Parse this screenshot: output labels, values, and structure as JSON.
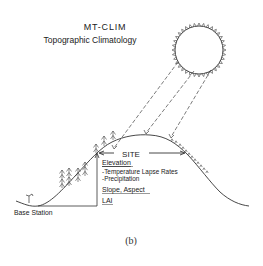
{
  "title": {
    "line1": "MT-CLIM",
    "line2": "Topographic Climatology"
  },
  "labels": {
    "site": "SITE",
    "elevation": "Elevation",
    "temperature_lapse": "-Temperature Lapse Rates",
    "precipitation": "-Precipitation",
    "slope_aspect": "Slope, Aspect",
    "lai": "LAI",
    "base_station": "Base Station"
  },
  "caption": "(b)",
  "icons": {
    "sun": "sun-icon",
    "trees": "conifer-trees-icon",
    "station": "weather-station-icon"
  }
}
